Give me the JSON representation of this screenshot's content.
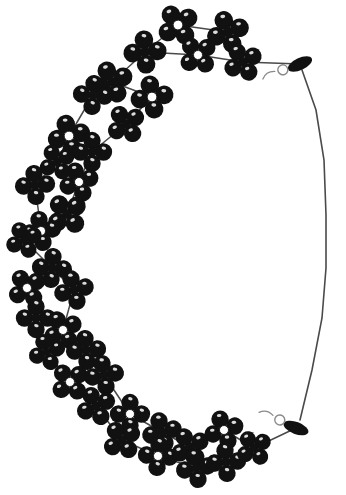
{
  "image": {
    "subject": "beaded-necklace",
    "background_color": "#ffffff",
    "bead_color": "#111111",
    "thread_color": "#4a4a4a",
    "clasp_color": "#8a8a8a",
    "highlight_color": "#ffffff",
    "width": 346,
    "height": 495
  },
  "necklace": {
    "clasp_top": {
      "name": "barrel-clasp-top",
      "x": 300,
      "y": 64,
      "angle": -25
    },
    "clasp_bottom": {
      "name": "barrel-clasp-bottom",
      "x": 296,
      "y": 428,
      "angle": 20
    },
    "cord_points": "302,70 316,110 324,160 326,215 326,268 322,318 312,370 300,420",
    "flower_clusters": [
      {
        "x": 178,
        "y": 25,
        "r": 15,
        "rot": 10
      },
      {
        "x": 228,
        "y": 32,
        "r": 15,
        "rot": 25
      },
      {
        "x": 145,
        "y": 52,
        "r": 15,
        "rot": 40
      },
      {
        "x": 198,
        "y": 55,
        "r": 14,
        "rot": 5
      },
      {
        "x": 243,
        "y": 62,
        "r": 14,
        "rot": 15
      },
      {
        "x": 112,
        "y": 82,
        "r": 15,
        "rot": 20
      },
      {
        "x": 152,
        "y": 97,
        "r": 15,
        "rot": 35
      },
      {
        "x": 93,
        "y": 95,
        "r": 14,
        "rot": 50
      },
      {
        "x": 126,
        "y": 124,
        "r": 14,
        "rot": 10
      },
      {
        "x": 69,
        "y": 136,
        "r": 15,
        "rot": 30
      },
      {
        "x": 92,
        "y": 152,
        "r": 14,
        "rot": 45
      },
      {
        "x": 57,
        "y": 162,
        "r": 13,
        "rot": 15
      },
      {
        "x": 79,
        "y": 182,
        "r": 14,
        "rot": 25
      },
      {
        "x": 35,
        "y": 185,
        "r": 14,
        "rot": 40
      },
      {
        "x": 67,
        "y": 214,
        "r": 15,
        "rot": 5
      },
      {
        "x": 41,
        "y": 231,
        "r": 14,
        "rot": 35
      },
      {
        "x": 24,
        "y": 240,
        "r": 13,
        "rot": 20
      },
      {
        "x": 52,
        "y": 268,
        "r": 14,
        "rot": 50
      },
      {
        "x": 27,
        "y": 288,
        "r": 14,
        "rot": 10
      },
      {
        "x": 74,
        "y": 290,
        "r": 14,
        "rot": 30
      },
      {
        "x": 36,
        "y": 318,
        "r": 14,
        "rot": 45
      },
      {
        "x": 63,
        "y": 330,
        "r": 14,
        "rot": 15
      },
      {
        "x": 47,
        "y": 352,
        "r": 13,
        "rot": 25
      },
      {
        "x": 86,
        "y": 350,
        "r": 14,
        "rot": 40
      },
      {
        "x": 70,
        "y": 382,
        "r": 14,
        "rot": 5
      },
      {
        "x": 104,
        "y": 375,
        "r": 14,
        "rot": 35
      },
      {
        "x": 96,
        "y": 406,
        "r": 14,
        "rot": 20
      },
      {
        "x": 130,
        "y": 414,
        "r": 14,
        "rot": 45
      },
      {
        "x": 122,
        "y": 440,
        "r": 14,
        "rot": 10
      },
      {
        "x": 162,
        "y": 432,
        "r": 14,
        "rot": 30
      },
      {
        "x": 158,
        "y": 456,
        "r": 14,
        "rot": 50
      },
      {
        "x": 190,
        "y": 447,
        "r": 14,
        "rot": 15
      },
      {
        "x": 196,
        "y": 468,
        "r": 14,
        "rot": 35
      },
      {
        "x": 224,
        "y": 430,
        "r": 14,
        "rot": 25
      },
      {
        "x": 226,
        "y": 462,
        "r": 14,
        "rot": 40
      },
      {
        "x": 254,
        "y": 448,
        "r": 13,
        "rot": 10
      }
    ],
    "link_segments": [
      "178,25 228,32",
      "178,25 145,52",
      "228,32 243,62",
      "145,52 198,55",
      "198,55 243,62",
      "145,52 112,82",
      "112,82 152,97",
      "112,82 93,95",
      "152,97 126,124",
      "93,95 69,136",
      "126,124 92,152",
      "69,136 57,162",
      "92,152 79,182",
      "57,162 35,185",
      "79,182 67,214",
      "35,185 41,231",
      "67,214 41,231",
      "41,231 24,240",
      "24,240 52,268",
      "52,268 27,288",
      "52,268 74,290",
      "27,288 36,318",
      "74,290 63,330",
      "36,318 47,352",
      "63,330 86,350",
      "47,352 70,382",
      "86,350 104,375",
      "70,382 96,406",
      "104,375 130,414",
      "96,406 122,440",
      "130,414 162,432",
      "122,440 158,456",
      "162,432 190,447",
      "158,456 196,468",
      "190,447 224,430",
      "196,468 226,462",
      "224,430 254,448",
      "226,462 254,448",
      "254,448 296,428",
      "243,62 300,64"
    ]
  }
}
